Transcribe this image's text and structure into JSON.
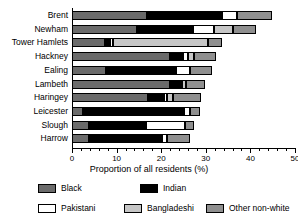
{
  "chart_data": {
    "type": "bar",
    "orientation": "horizontal",
    "stacked": true,
    "title": "",
    "xlabel": "Proportion of all residents (%)",
    "ylabel": "",
    "xlim": [
      0,
      50
    ],
    "xticks": [
      0,
      10,
      20,
      30,
      40,
      50
    ],
    "xtick_labels": [
      "0",
      "10",
      "20",
      "30",
      "40",
      "50"
    ],
    "minor_tick_step": 2,
    "grid": false,
    "legend_position": "bottom",
    "categories": [
      "Brent",
      "Newham",
      "Tower Hamlets",
      "Hackney",
      "Ealing",
      "Lambeth",
      "Haringey",
      "Leicester",
      "Slough",
      "Harrow"
    ],
    "series": [
      {
        "name": "Black",
        "color": "#6b6b6b",
        "values": [
          16.8,
          14.6,
          7.4,
          22.0,
          7.6,
          22.0,
          17.0,
          2.5,
          3.8,
          3.8
        ]
      },
      {
        "name": "Indian",
        "color": "#000000",
        "values": [
          16.8,
          12.6,
          1.2,
          2.9,
          15.7,
          2.2,
          3.6,
          22.6,
          12.8,
          16.4
        ]
      },
      {
        "name": "Pakistani",
        "color": "#ffffff",
        "values": [
          3.4,
          4.7,
          0.5,
          1.1,
          3.1,
          0.5,
          0.7,
          1.3,
          8.7,
          1.1
        ]
      },
      {
        "name": "Bangladeshi",
        "color": "#c6c6c6",
        "values": [
          0.0,
          4.3,
          21.5,
          1.3,
          0.0,
          0.9,
          1.3,
          0.0,
          0.0,
          0.0
        ]
      },
      {
        "name": "Other non-white",
        "color": "#8f8f8f",
        "values": [
          7.8,
          5.1,
          3.1,
          5.1,
          5.0,
          4.2,
          6.3,
          2.4,
          2.1,
          5.2
        ]
      }
    ],
    "totals": [
      44.8,
      41.3,
      35.2,
      32.4,
      31.4,
      29.8,
      28.9,
      28.8,
      27.4,
      26.5
    ],
    "legend_entries": [
      "Black",
      "Indian",
      "Pakistani",
      "Bangladeshi",
      "Other non-white"
    ]
  },
  "colors": {
    "black_cat": "#6b6b6b",
    "indian_cat": "#000000",
    "pakistani_cat": "#ffffff",
    "bangladeshi_cat": "#c6c6c6",
    "other_cat": "#8f8f8f",
    "axis": "#000000",
    "background": "#ffffff"
  }
}
